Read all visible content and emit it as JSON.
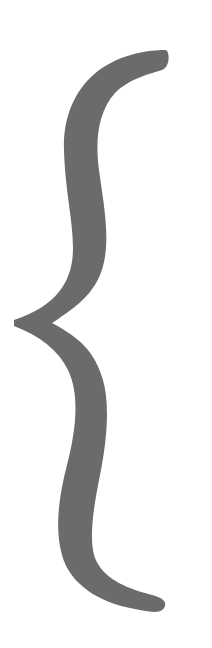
{
  "glyph": {
    "name": "left-curly-brace",
    "character": "{",
    "color": "#6b6b6b",
    "background": "#ffffff"
  }
}
